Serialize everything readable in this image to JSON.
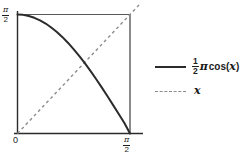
{
  "chart_data": {
    "type": "line",
    "title": "",
    "xlabel": "",
    "ylabel": "",
    "xlim": [
      0,
      1.5707963
    ],
    "ylim": [
      0,
      1.5707963
    ],
    "grid": false,
    "legend_position": "right",
    "x_ticks": [
      {
        "value": 0,
        "label": "0"
      },
      {
        "value": 1.5707963,
        "label": "pi/2",
        "numerator": "π",
        "denominator": "2"
      }
    ],
    "y_ticks": [
      {
        "value": 1.5707963,
        "label": "pi/2",
        "numerator": "π",
        "denominator": "2"
      }
    ],
    "series": [
      {
        "name": "half-pi-cos-x",
        "style": "solid",
        "color": "#2b2b2b",
        "linewidth": 2,
        "x": [
          0.0,
          0.0785,
          0.1571,
          0.2356,
          0.3142,
          0.3927,
          0.4712,
          0.5498,
          0.6283,
          0.7069,
          0.7854,
          0.8639,
          0.9425,
          1.021,
          1.0996,
          1.1781,
          1.2566,
          1.3352,
          1.4137,
          1.4923,
          1.5708
        ],
        "y": [
          1.5708,
          1.5659,
          1.5514,
          1.5274,
          1.494,
          1.4514,
          1.3999,
          1.3398,
          1.2715,
          1.1955,
          1.1107,
          1.0215,
          0.9253,
          0.8235,
          0.7168,
          0.606,
          0.4918,
          0.375,
          0.2566,
          0.1374,
          0.0
        ]
      },
      {
        "name": "identity-x",
        "style": "dashed",
        "color": "#8c8c8c",
        "linewidth": 1.4,
        "x": [
          0.0,
          1.5707963
        ],
        "y": [
          0.0,
          1.5707963
        ]
      }
    ],
    "intersection": {
      "x": 0.8654,
      "y": 0.8654
    }
  },
  "legend": {
    "entries": [
      {
        "name": "legend-entry-half-pi-cos",
        "fraction_numerator": "1",
        "fraction_denominator": "2",
        "pi_symbol": "π",
        "function_text": "cos(",
        "variable": "x",
        "closing": ")",
        "line_style": "solid"
      },
      {
        "name": "legend-entry-x",
        "variable": "x",
        "line_style": "dashed"
      }
    ]
  },
  "axes": {
    "y_axis_label": {
      "numerator": "π",
      "denominator": "2"
    },
    "x_axis_origin_label": "0",
    "x_axis_max_label": {
      "numerator": "π",
      "denominator": "2"
    }
  },
  "colors": {
    "background": "#ffffff",
    "curve": "#2b2b2b",
    "identity_line": "#8c8c8c",
    "frame": "#5a5a5a",
    "axis": "#2b2b2b",
    "text": "#1d1d1d"
  }
}
